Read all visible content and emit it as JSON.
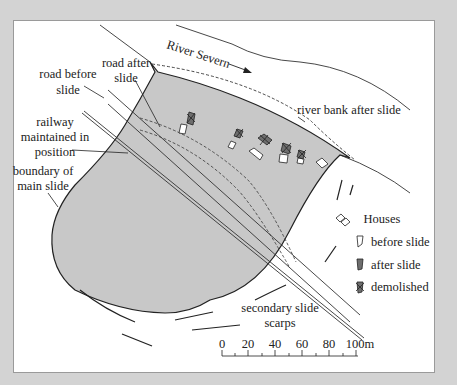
{
  "labels": {
    "river": "River Severn",
    "road_before": [
      "road before",
      "slide"
    ],
    "road_after": [
      "road after",
      "slide"
    ],
    "railway": [
      "railway",
      "maintained in",
      "position"
    ],
    "boundary": [
      "boundary of",
      "main slide"
    ],
    "river_bank": "river bank after slide",
    "secondary": [
      "secondary slide",
      "scarps"
    ]
  },
  "legend": {
    "title": "Houses",
    "items": [
      {
        "label": "before slide",
        "style": "outline"
      },
      {
        "label": "after slide",
        "style": "filled"
      },
      {
        "label": "demolished",
        "style": "filled-crossed"
      }
    ]
  },
  "scale_bar": {
    "ticks": [
      "0",
      "20",
      "40",
      "60",
      "80",
      "100m"
    ],
    "unit": "m"
  },
  "colors": {
    "slide_fill": "#c8c8c8",
    "house_after": "#6e6e6e",
    "frame": "#d3d3d3"
  }
}
